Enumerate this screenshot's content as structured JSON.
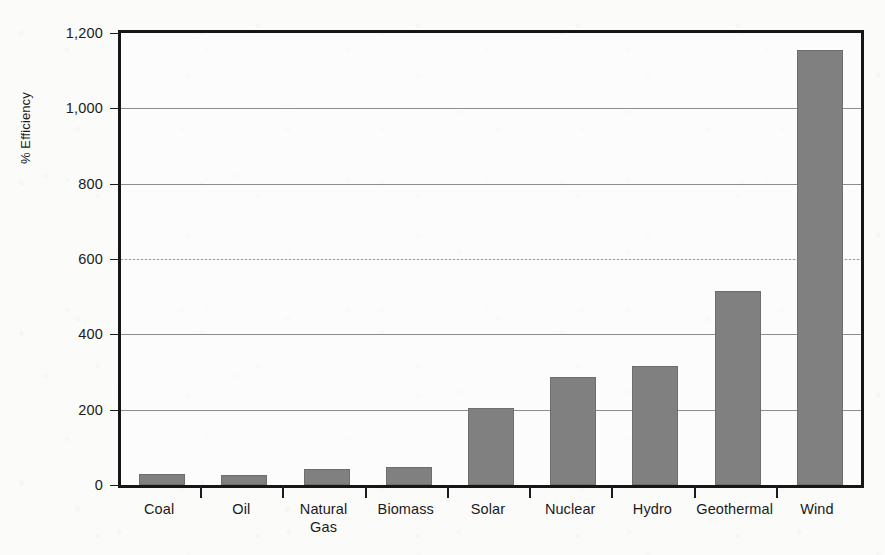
{
  "chart_data": {
    "type": "bar",
    "title": "",
    "subtitle": "",
    "xlabel": "",
    "ylabel": "% Efficiency",
    "ylim": [
      0,
      1200
    ],
    "grid": true,
    "legend": false,
    "legend_position": "none",
    "bar_color": "#808080",
    "axis_color": "#161616",
    "gridline_color": "#8e8e8e",
    "background_color": "#fbfbfa",
    "categories": [
      "Coal",
      "Oil",
      "Natural\nGas",
      "Biomass",
      "Solar",
      "Nuclear",
      "Hydro",
      "Geothermal",
      "Wind"
    ],
    "values": [
      29,
      27,
      42,
      48,
      205,
      288,
      315,
      515,
      1155
    ],
    "ytick_values": [
      0,
      200,
      400,
      600,
      800,
      1000,
      1200
    ],
    "ytick_labels": [
      "0",
      "200",
      "400",
      "600",
      "800",
      "1,000",
      "1,200"
    ]
  }
}
